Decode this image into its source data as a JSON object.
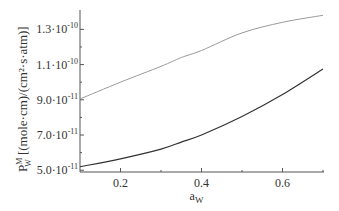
{
  "chart_data": {
    "type": "line",
    "title": "",
    "xlabel": "a",
    "xlabel_sub": "W",
    "ylabel_main": "P",
    "ylabel_sup": "M",
    "ylabel_sub": "W",
    "ylabel_units": "[(mole·cm)/(cm²·s·atm)]",
    "xlim": [
      0.1,
      0.7
    ],
    "ylim": [
      4.9e-11,
      1.41e-10
    ],
    "x_ticks": [
      0.2,
      0.4,
      0.6
    ],
    "x_tick_labels": [
      "0.2",
      "0.4",
      "0.6"
    ],
    "x_minor_ticks": [
      0.3,
      0.5,
      0.7
    ],
    "y_ticks": [
      5e-11,
      7e-11,
      9e-11,
      1.1e-10,
      1.3e-10
    ],
    "y_tick_labels": [
      {
        "mant": "5.0·10",
        "exp": "-11"
      },
      {
        "mant": "7.0·10",
        "exp": "-11"
      },
      {
        "mant": "9.0·10",
        "exp": "-11"
      },
      {
        "mant": "1.1·10",
        "exp": "-10"
      },
      {
        "mant": "1.3·10",
        "exp": "-10"
      }
    ],
    "y_minor_ticks": [
      6e-11,
      8e-11,
      1e-10,
      1.2e-10
    ],
    "grid": false,
    "legend": null,
    "x": [
      0.1,
      0.2,
      0.3,
      0.35,
      0.4,
      0.5,
      0.6,
      0.7
    ],
    "series": [
      {
        "name": "upper curve",
        "color": "#9a9a9a",
        "values": [
          9.05e-11,
          1e-10,
          1.09e-10,
          1.14e-10,
          1.18e-10,
          1.28e-10,
          1.34e-10,
          1.38e-10
        ]
      },
      {
        "name": "lower curve",
        "color": "#333333",
        "values": [
          5.2e-11,
          5.65e-11,
          6.2e-11,
          6.6e-11,
          7e-11,
          8.05e-11,
          9.3e-11,
          1.075e-10
        ]
      }
    ]
  }
}
